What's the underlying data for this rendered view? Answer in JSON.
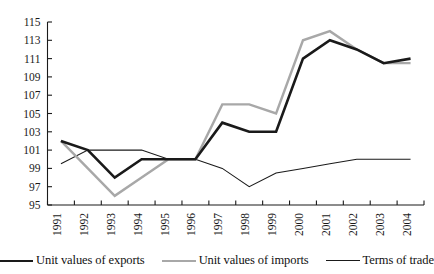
{
  "chart_data": {
    "type": "line",
    "title": "",
    "xlabel": "",
    "ylabel": "",
    "categories": [
      "1991",
      "1992",
      "1993",
      "1994",
      "1995",
      "1996",
      "1997",
      "1998",
      "1999",
      "2000",
      "2001",
      "2002",
      "2003",
      "2004"
    ],
    "ylim": [
      95,
      115
    ],
    "ytick_labels": [
      "95",
      "97",
      "99",
      "101",
      "103",
      "105",
      "107",
      "109",
      "111",
      "113",
      "115"
    ],
    "ytick_values": [
      95,
      97,
      99,
      101,
      103,
      105,
      107,
      109,
      111,
      113,
      115
    ],
    "grid": false,
    "legend_position": "bottom",
    "series": [
      {
        "name": "Unit values of exports",
        "color": "#1a1a1a",
        "style": "thick-black",
        "values": [
          102,
          101,
          98,
          100,
          100,
          100,
          104,
          103,
          103,
          111,
          113,
          112,
          110.5,
          111
        ]
      },
      {
        "name": "Unit values of imports",
        "color": "#a8a8a8",
        "style": "thick-gray",
        "values": [
          102,
          99,
          96,
          98,
          100,
          100,
          106,
          106,
          105,
          113,
          114,
          112,
          110.5,
          110.5
        ]
      },
      {
        "name": "Terms of trade",
        "color": "#1a1a1a",
        "style": "thin-black",
        "values": [
          99.5,
          101,
          101,
          101,
          100,
          100,
          99,
          97,
          98.5,
          99,
          99.5,
          100,
          100,
          100
        ]
      }
    ]
  },
  "legend": {
    "entries": [
      {
        "label": "Unit values of exports",
        "swatch": "thick-black"
      },
      {
        "label": "Unit values of imports",
        "swatch": "thick-gray"
      },
      {
        "label": "Terms of trade",
        "swatch": "thin-black"
      }
    ]
  }
}
